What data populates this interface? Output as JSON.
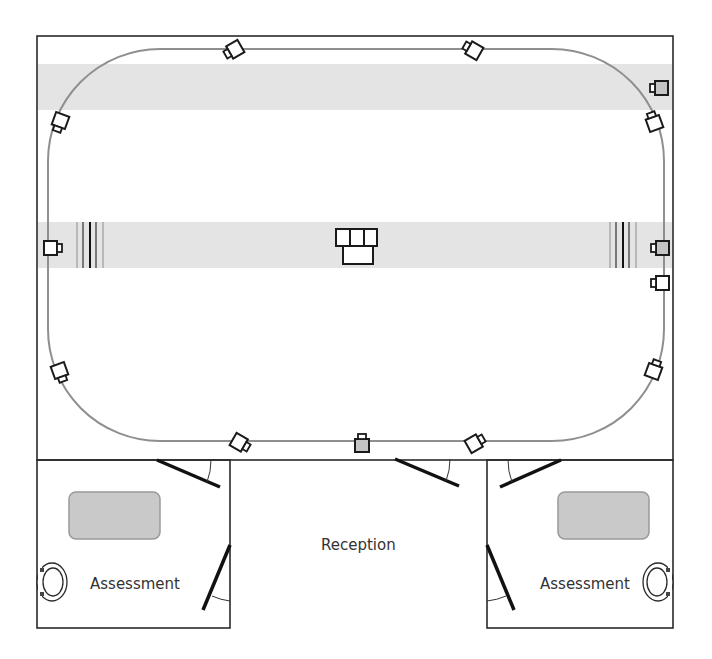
{
  "diagram": {
    "type": "floor-plan",
    "colors": {
      "wall": "#2a2a2a",
      "track": "#8f8f8f",
      "band": "#e4e4e4",
      "table_fill": "#c9c9c9",
      "table_stroke": "#999999",
      "camera_fill_gray": "#c4c4c4",
      "door": "#111111"
    },
    "rooms": [
      {
        "id": "main-arena",
        "label": ""
      },
      {
        "id": "assessment-left",
        "label": "Assessment"
      },
      {
        "id": "reception",
        "label": "Reception"
      },
      {
        "id": "assessment-right",
        "label": "Assessment"
      }
    ],
    "labels": {
      "reception": "Reception",
      "assessment_left": "Assessment",
      "assessment_right": "Assessment"
    },
    "cameras": [
      {
        "id": "cam-top-left",
        "x": 234,
        "y": 50,
        "angle": 150,
        "fill": "white"
      },
      {
        "id": "cam-top-right",
        "x": 473,
        "y": 50,
        "angle": 210,
        "fill": "white"
      },
      {
        "id": "cam-left-upper",
        "x": 60,
        "y": 122,
        "angle": 110,
        "fill": "white"
      },
      {
        "id": "cam-right-upper",
        "x": 654,
        "y": 122,
        "angle": 250,
        "fill": "white"
      },
      {
        "id": "cam-right-band",
        "x": 660,
        "y": 88,
        "angle": 180,
        "fill": "gray"
      },
      {
        "id": "cam-left-mid",
        "x": 52,
        "y": 248,
        "angle": 0,
        "fill": "white"
      },
      {
        "id": "cam-right-mid-gray",
        "x": 661,
        "y": 248,
        "angle": 180,
        "fill": "gray"
      },
      {
        "id": "cam-right-mid",
        "x": 661,
        "y": 283,
        "angle": 180,
        "fill": "white"
      },
      {
        "id": "cam-left-lower",
        "x": 60,
        "y": 372,
        "angle": 70,
        "fill": "white"
      },
      {
        "id": "cam-right-lower",
        "x": 654,
        "y": 370,
        "angle": 290,
        "fill": "white"
      },
      {
        "id": "cam-bottom-left",
        "x": 240,
        "y": 443,
        "angle": 30,
        "fill": "white"
      },
      {
        "id": "cam-bottom-center",
        "x": 362,
        "y": 444,
        "angle": 270,
        "fill": "gray"
      },
      {
        "id": "cam-bottom-right",
        "x": 475,
        "y": 443,
        "angle": 330,
        "fill": "white"
      }
    ]
  }
}
